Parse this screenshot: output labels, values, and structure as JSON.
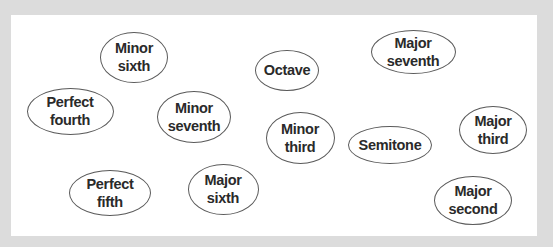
{
  "colors": {
    "frame": "#dcdcdc",
    "panel": "#ffffff",
    "bubble_border": "#5a5a5a",
    "text": "#2a2a2a"
  },
  "bubbles": [
    {
      "id": "minor-sixth",
      "label": "Minor\nsixth",
      "cx": 134,
      "cy": 57,
      "w": 68,
      "h": 51
    },
    {
      "id": "octave",
      "label": "Octave",
      "cx": 287,
      "cy": 70,
      "w": 64,
      "h": 41
    },
    {
      "id": "major-seventh",
      "label": "Major\nseventh",
      "cx": 413,
      "cy": 52,
      "w": 85,
      "h": 44
    },
    {
      "id": "perfect-fourth",
      "label": "Perfect\nfourth",
      "cx": 70,
      "cy": 111,
      "w": 87,
      "h": 47
    },
    {
      "id": "minor-seventh",
      "label": "Minor\nseventh",
      "cx": 194,
      "cy": 117,
      "w": 74,
      "h": 52
    },
    {
      "id": "minor-third",
      "label": "Minor\nthird",
      "cx": 300,
      "cy": 138,
      "w": 69,
      "h": 52
    },
    {
      "id": "semitone",
      "label": "Semitone",
      "cx": 390,
      "cy": 145,
      "w": 84,
      "h": 38
    },
    {
      "id": "major-third",
      "label": "Major\nthird",
      "cx": 493,
      "cy": 130,
      "w": 68,
      "h": 48
    },
    {
      "id": "perfect-fifth",
      "label": "Perfect\nfifth",
      "cx": 110,
      "cy": 193,
      "w": 82,
      "h": 46
    },
    {
      "id": "major-sixth",
      "label": "Major\nsixth",
      "cx": 223,
      "cy": 189,
      "w": 71,
      "h": 51
    },
    {
      "id": "major-second",
      "label": "Major\nsecond",
      "cx": 473,
      "cy": 200,
      "w": 78,
      "h": 49
    }
  ]
}
